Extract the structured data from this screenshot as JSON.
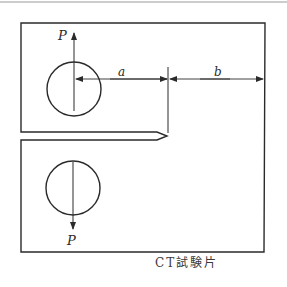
{
  "diagram": {
    "title": "CT試験片",
    "specimen": "Compact tension (CT) specimen",
    "labels": {
      "load_top": "P",
      "load_bottom": "P",
      "crack_length": "a",
      "ligament": "b",
      "caption": "CT試験片"
    },
    "colors": {
      "line": "#2a2a2a",
      "background": "#ffffff",
      "top_rule": "#9a9a9a"
    }
  }
}
